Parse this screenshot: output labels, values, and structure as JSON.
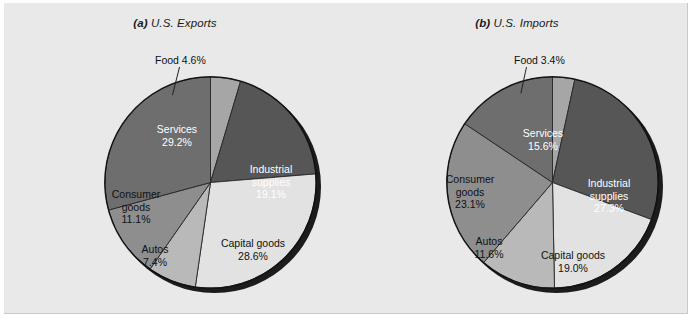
{
  "figure": {
    "background_color": "#e9e9e9",
    "border_color": "#c9c9c9"
  },
  "chart_data": [
    {
      "type": "pie",
      "title": "(a) U.S. Exports",
      "title_tag": "(a)",
      "title_text": "U.S. Exports",
      "categories": [
        "Food",
        "Industrial supplies",
        "Capital goods",
        "Autos",
        "Consumer goods",
        "Services"
      ],
      "values": [
        4.6,
        19.1,
        28.6,
        7.4,
        11.1,
        29.2
      ],
      "value_labels": [
        "4.6%",
        "19.1%",
        "28.6%",
        "7.4%",
        "11.1%",
        "29.2%"
      ],
      "colors": [
        "#a6a6a6",
        "#565656",
        "#e2e2e2",
        "#b9b9b9",
        "#8e8e8e",
        "#6e6e6e"
      ],
      "label_colors": [
        "dark",
        "light",
        "dark",
        "dark",
        "dark",
        "light"
      ],
      "start_angle_deg": 0,
      "legend": "none",
      "grid": false,
      "callout": {
        "label": "Food 4.6%",
        "target_slice": "Food"
      },
      "slice_labels": [
        {
          "name": "Services",
          "line1": "Services",
          "line2": "29.2%"
        },
        {
          "name": "Industrial supplies",
          "line1": "Industrial",
          "line2": "supplies",
          "line3": "19.1%"
        },
        {
          "name": "Capital goods",
          "line1": "Capital goods",
          "line2": "28.6%"
        },
        {
          "name": "Autos",
          "line1": "Autos",
          "line2": "7.4%"
        },
        {
          "name": "Consumer goods",
          "line1": "Consumer",
          "line2": "goods",
          "line3": "11.1%"
        }
      ]
    },
    {
      "type": "pie",
      "title": "(b) U.S. Imports",
      "title_tag": "(b)",
      "title_text": "U.S. Imports",
      "categories": [
        "Food",
        "Industrial supplies",
        "Capital goods",
        "Autos",
        "Consumer goods",
        "Services"
      ],
      "values": [
        3.4,
        27.3,
        19.0,
        11.6,
        23.1,
        15.6
      ],
      "value_labels": [
        "3.4%",
        "27.3%",
        "19.0%",
        "11.6%",
        "23.1%",
        "15.6%"
      ],
      "colors": [
        "#a6a6a6",
        "#565656",
        "#e2e2e2",
        "#b9b9b9",
        "#8e8e8e",
        "#6e6e6e"
      ],
      "label_colors": [
        "dark",
        "light",
        "dark",
        "dark",
        "dark",
        "light"
      ],
      "start_angle_deg": 0,
      "legend": "none",
      "grid": false,
      "callout": {
        "label": "Food 3.4%",
        "target_slice": "Food"
      },
      "slice_labels": [
        {
          "name": "Services",
          "line1": "Services",
          "line2": "15.6%"
        },
        {
          "name": "Industrial supplies",
          "line1": "Industrial",
          "line2": "supplies",
          "line3": "27.3%"
        },
        {
          "name": "Capital goods",
          "line1": "Capital goods",
          "line2": "19.0%"
        },
        {
          "name": "Autos",
          "line1": "Autos",
          "line2": "11.6%"
        },
        {
          "name": "Consumer goods",
          "line1": "Consumer",
          "line2": "goods",
          "line3": "23.1%"
        }
      ]
    }
  ]
}
